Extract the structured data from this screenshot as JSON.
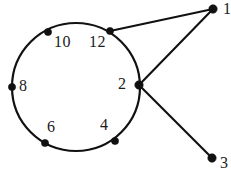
{
  "diagram": {
    "type": "node-link-diagram",
    "stroke_color": "#111111",
    "background_color": "#ffffff",
    "node_fill": "#111111",
    "nodes": [
      {
        "id": "n12",
        "label": "12",
        "cx": 110,
        "cy": 31,
        "r": 3.6,
        "label_x": 89,
        "label_y": 34,
        "on_cycle": true
      },
      {
        "id": "n10",
        "label": "10",
        "cx": 48,
        "cy": 32,
        "r": 3.6,
        "label_x": 54,
        "label_y": 34,
        "on_cycle": true
      },
      {
        "id": "n8",
        "label": "8",
        "cx": 12,
        "cy": 87,
        "r": 3.6,
        "label_x": 19,
        "label_y": 78,
        "on_cycle": true
      },
      {
        "id": "n6",
        "label": "6",
        "cx": 45,
        "cy": 143,
        "r": 3.6,
        "label_x": 47,
        "label_y": 119,
        "on_cycle": true
      },
      {
        "id": "n4",
        "label": "4",
        "cx": 115,
        "cy": 141,
        "r": 3.6,
        "label_x": 100,
        "label_y": 117,
        "on_cycle": true
      },
      {
        "id": "n2",
        "label": "2",
        "cx": 139,
        "cy": 85,
        "r": 4.2,
        "label_x": 118,
        "label_y": 76,
        "on_cycle": true
      },
      {
        "id": "n1",
        "label": "1",
        "cx": 213,
        "cy": 9,
        "r": 4.2,
        "label_x": 223,
        "label_y": 1,
        "on_cycle": false
      },
      {
        "id": "n3",
        "label": "3",
        "cx": 212,
        "cy": 158,
        "r": 4.2,
        "label_x": 220,
        "label_y": 155,
        "on_cycle": false
      }
    ],
    "edges": [
      {
        "id": "e-12-1",
        "from": "n12",
        "to": "n1",
        "x1": 110,
        "y1": 31,
        "x2": 213,
        "y2": 9
      },
      {
        "id": "e-2-1",
        "from": "n2",
        "to": "n1",
        "x1": 139,
        "y1": 85,
        "x2": 213,
        "y2": 9
      },
      {
        "id": "e-2-3",
        "from": "n2",
        "to": "n3",
        "x1": 139,
        "y1": 85,
        "x2": 212,
        "y2": 158
      }
    ],
    "cycle": {
      "id": "main-circle",
      "cx": 76,
      "cy": 87,
      "r": 64,
      "description": "closed loop through nodes 12, 10, 8, 6, 4, 2"
    }
  }
}
